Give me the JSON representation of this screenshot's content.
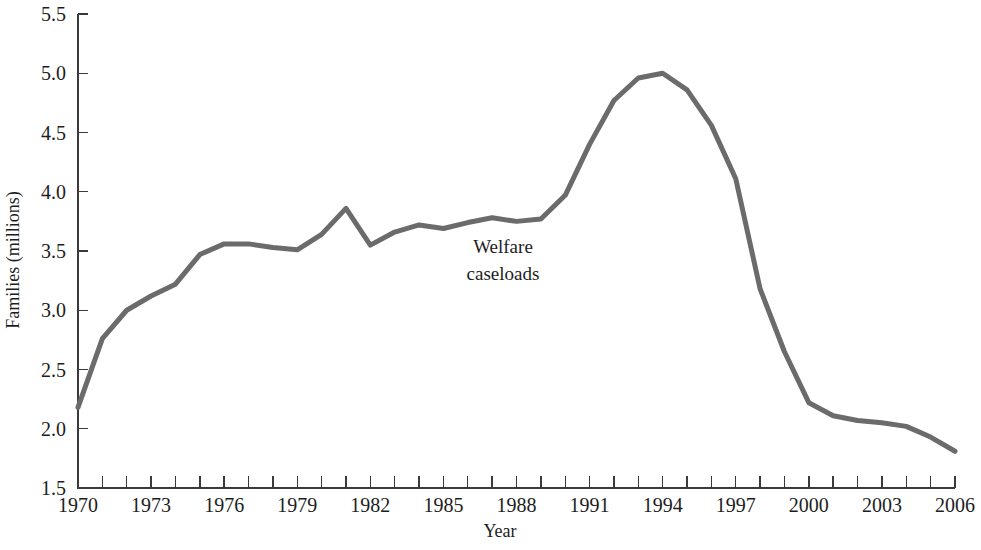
{
  "chart_data": {
    "type": "line",
    "title": "",
    "xlabel": "Year",
    "ylabel": "Families (millions)",
    "xlim": [
      1970,
      2006
    ],
    "ylim": [
      1.5,
      5.5
    ],
    "grid": false,
    "legend_position": "inline-annotation",
    "annotations": [
      {
        "text_line1": "Welfare",
        "text_line2": "caseloads",
        "x": 1986,
        "y": 3.35
      }
    ],
    "y_ticks": [
      "1.5",
      "2.0",
      "2.5",
      "3.0",
      "3.5",
      "4.0",
      "4.5",
      "5.0",
      "5.5"
    ],
    "y_tick_values": [
      1.5,
      2.0,
      2.5,
      3.0,
      3.5,
      4.0,
      4.5,
      5.0,
      5.5
    ],
    "x_ticks_labeled": [
      "1970",
      "1973",
      "1976",
      "1979",
      "1982",
      "1985",
      "1988",
      "1991",
      "1994",
      "1997",
      "2000",
      "2003",
      "2006"
    ],
    "x_tick_values_all": [
      1970,
      1971,
      1972,
      1973,
      1974,
      1975,
      1976,
      1977,
      1978,
      1979,
      1980,
      1981,
      1982,
      1983,
      1984,
      1985,
      1986,
      1987,
      1988,
      1989,
      1990,
      1991,
      1992,
      1993,
      1994,
      1995,
      1996,
      1997,
      1998,
      1999,
      2000,
      2001,
      2002,
      2003,
      2004,
      2005,
      2006
    ],
    "series": [
      {
        "name": "Welfare caseloads",
        "color": "#6b6b6b",
        "x": [
          1970,
          1971,
          1972,
          1973,
          1974,
          1975,
          1976,
          1977,
          1978,
          1979,
          1980,
          1981,
          1982,
          1983,
          1984,
          1985,
          1986,
          1987,
          1988,
          1989,
          1990,
          1991,
          1992,
          1993,
          1994,
          1995,
          1996,
          1997,
          1998,
          1999,
          2000,
          2001,
          2002,
          2003,
          2004,
          2005,
          2006
        ],
        "values": [
          2.18,
          2.76,
          3.0,
          3.12,
          3.22,
          3.47,
          3.56,
          3.56,
          3.53,
          3.51,
          3.64,
          3.86,
          3.55,
          3.66,
          3.72,
          3.69,
          3.74,
          3.78,
          3.75,
          3.77,
          3.97,
          4.4,
          4.77,
          4.96,
          5.0,
          4.86,
          4.56,
          4.11,
          3.18,
          2.65,
          2.22,
          2.11,
          2.07,
          2.05,
          2.02,
          1.93,
          1.81
        ]
      }
    ]
  },
  "axes": {
    "x_axis_title": "Year",
    "y_axis_title": "Families (millions)"
  }
}
